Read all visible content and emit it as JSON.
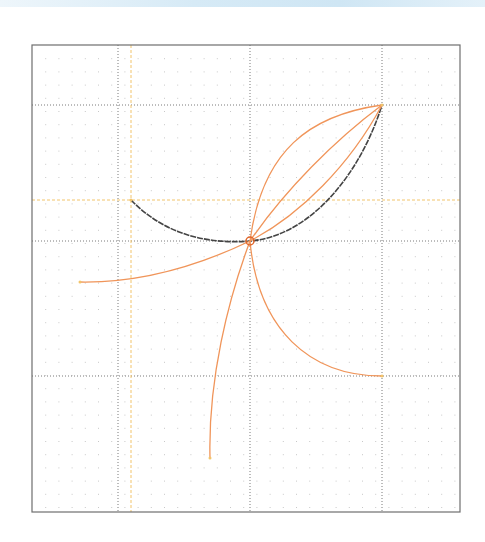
{
  "diagram": {
    "type": "bezier-curve-construction",
    "frame": {
      "x": 32,
      "y": 45,
      "width": 428,
      "height": 467,
      "stroke": "#6e6e6e"
    },
    "grid": {
      "minor_spacing": 13.2,
      "minor_color": "#c8c8c8",
      "major_color": "#7a7a7a",
      "major_x": [
        118,
        250,
        382
      ],
      "major_y": [
        105,
        241,
        376
      ]
    },
    "guides": {
      "color": "#f2c46a",
      "vertical_x": 131,
      "horizontal_y": 200
    },
    "colors": {
      "accent": "#f0955a",
      "dark_curve": "#444444",
      "anchor": "#e0662a"
    },
    "center_point": {
      "x": 250,
      "y": 241,
      "label": ""
    },
    "dark_curve": {
      "path": "M131,200 C160,230 200,245 250,241 C310,236 360,175 382,105"
    },
    "orange_curves": [
      {
        "name": "upper-arc",
        "path": "M250,241 C262,150 310,115 382,105"
      },
      {
        "name": "middle-arc-1",
        "path": "M250,241 C285,190 335,140 382,105"
      },
      {
        "name": "middle-arc-2",
        "path": "M250,241 C300,215 350,165 382,105"
      },
      {
        "name": "left-arc",
        "path": "M250,241 C200,265 140,283 80,282"
      },
      {
        "name": "bottom-arc",
        "path": "M250,241 C228,300 208,380 210,458"
      },
      {
        "name": "lower-right-arc",
        "path": "M250,241 C258,330 310,376 382,376"
      }
    ],
    "endpoints": [
      {
        "x": 131,
        "y": 200
      },
      {
        "x": 382,
        "y": 105
      },
      {
        "x": 80,
        "y": 282
      },
      {
        "x": 210,
        "y": 458
      },
      {
        "x": 382,
        "y": 376
      }
    ]
  }
}
